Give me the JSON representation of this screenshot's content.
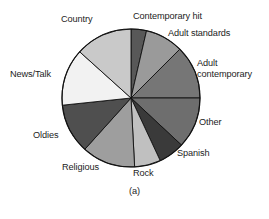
{
  "figure": {
    "caption": "(a)",
    "background_color": "#ffffff",
    "outline_color": "#000000"
  },
  "chart_data": {
    "type": "pie",
    "title": "",
    "subtitle": "",
    "xlabel": "",
    "ylabel": "",
    "legend_position": "none",
    "labels_position": "outside-callout",
    "grid": false,
    "start_angle_deg": 0,
    "direction": "clockwise",
    "center": {
      "x": 131,
      "y": 98
    },
    "radius": 69,
    "categories": [
      "Contemporary hit",
      "Adult standards",
      "Adult contemporary",
      "Other",
      "Spanish",
      "Rock",
      "Religious",
      "Oldies",
      "News/Talk",
      "Country"
    ],
    "values": [
      3.6,
      8.9,
      12.5,
      11.9,
      6.1,
      6.1,
      12.5,
      11.7,
      13.3,
      13.4
    ],
    "unit": "percent",
    "slices": [
      {
        "label": "Contemporary hit",
        "value": 3.6,
        "angle_deg": 13,
        "color": "#585858"
      },
      {
        "label": "Adult standards",
        "value": 8.9,
        "angle_deg": 32,
        "color": "#9a9a9a"
      },
      {
        "label": "Adult contemporary",
        "value": 12.5,
        "angle_deg": 45,
        "color": "#767676"
      },
      {
        "label": "Other",
        "value": 11.9,
        "angle_deg": 43,
        "color": "#6e6e6e"
      },
      {
        "label": "Spanish",
        "value": 6.1,
        "angle_deg": 22,
        "color": "#3a3a3a"
      },
      {
        "label": "Rock",
        "value": 6.1,
        "angle_deg": 22,
        "color": "#c0c0c0"
      },
      {
        "label": "Religious",
        "value": 12.5,
        "angle_deg": 45,
        "color": "#9e9e9e"
      },
      {
        "label": "Oldies",
        "value": 11.7,
        "angle_deg": 42,
        "color": "#4f4f4f"
      },
      {
        "label": "News/Talk",
        "value": 13.3,
        "angle_deg": 48,
        "color": "#f2f2f2"
      },
      {
        "label": "Country",
        "value": 13.4,
        "angle_deg": 48,
        "color": "#c9c9c9"
      }
    ]
  },
  "labels": {
    "country": "Country",
    "contemporary_hit": "Contemporary hit",
    "adult_standards": "Adult standards",
    "adult_contemporary_line1": "Adult",
    "adult_contemporary_line2": "contemporary",
    "other": "Other",
    "spanish": "Spanish",
    "rock": "Rock",
    "religious": "Religious",
    "oldies": "Oldies",
    "news_talk": "News/Talk"
  }
}
